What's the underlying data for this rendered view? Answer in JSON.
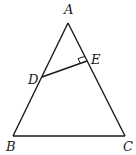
{
  "diagram": {
    "type": "triangle-geometry",
    "points": {
      "A": {
        "label": "A",
        "x": 68,
        "y": 23
      },
      "B": {
        "label": "B",
        "x": 13,
        "y": 136
      },
      "C": {
        "label": "C",
        "x": 125,
        "y": 136
      },
      "D": {
        "label": "D",
        "x": 42,
        "y": 77
      },
      "E": {
        "label": "E",
        "x": 87,
        "y": 61
      }
    },
    "segments": [
      "AB",
      "BC",
      "CA",
      "DE"
    ],
    "right_angle_at": "E",
    "stroke_color": "#1a1a1a"
  }
}
